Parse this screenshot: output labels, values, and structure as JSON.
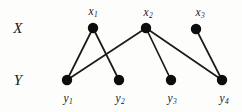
{
  "figure": {
    "type": "bipartite-graph-diagram",
    "width": 242,
    "height": 112,
    "background_color": "#fdfdfc",
    "node_color": "#0d0d0d",
    "edge_color": "#1a1a1a"
  },
  "set_labels": [
    {
      "id": "X",
      "text": "X",
      "x": 18,
      "y": 28
    },
    {
      "id": "Y",
      "text": "Y",
      "x": 18,
      "y": 80
    }
  ],
  "nodes": [
    {
      "id": "x1",
      "set": "X",
      "label": "x",
      "sub": "1",
      "cx": 93,
      "cy": 28,
      "r": 5.2,
      "label_x": 93,
      "label_y": 11
    },
    {
      "id": "x2",
      "set": "X",
      "label": "x",
      "sub": "2",
      "cx": 146,
      "cy": 28,
      "r": 5.2,
      "label_x": 148,
      "label_y": 12
    },
    {
      "id": "x3",
      "set": "X",
      "label": "x",
      "sub": "3",
      "cx": 196,
      "cy": 29,
      "r": 5.2,
      "label_x": 200,
      "label_y": 12
    },
    {
      "id": "y1",
      "set": "Y",
      "label": "y",
      "sub": "1",
      "cx": 67,
      "cy": 80,
      "r": 5.2,
      "label_x": 68,
      "label_y": 98
    },
    {
      "id": "y2",
      "set": "Y",
      "label": "y",
      "sub": "2",
      "cx": 119,
      "cy": 80,
      "r": 5.2,
      "label_x": 120,
      "label_y": 98
    },
    {
      "id": "y3",
      "set": "Y",
      "label": "y",
      "sub": "3",
      "cx": 171,
      "cy": 80,
      "r": 5.2,
      "label_x": 172,
      "label_y": 98
    },
    {
      "id": "y4",
      "set": "Y",
      "label": "y",
      "sub": "4",
      "cx": 222,
      "cy": 80,
      "r": 5.2,
      "label_x": 224,
      "label_y": 98
    }
  ],
  "edges": [
    {
      "from": "x1",
      "to": "y1",
      "x1": 93,
      "y1": 28,
      "x2": 67,
      "y2": 80
    },
    {
      "from": "x1",
      "to": "y2",
      "x1": 93,
      "y1": 28,
      "x2": 119,
      "y2": 80
    },
    {
      "from": "x2",
      "to": "y1",
      "x1": 146,
      "y1": 28,
      "x2": 67,
      "y2": 80
    },
    {
      "from": "x2",
      "to": "y3",
      "x1": 146,
      "y1": 28,
      "x2": 171,
      "y2": 80
    },
    {
      "from": "x2",
      "to": "y4",
      "x1": 146,
      "y1": 28,
      "x2": 222,
      "y2": 80
    },
    {
      "from": "x3",
      "to": "y4",
      "x1": 196,
      "y1": 29,
      "x2": 222,
      "y2": 80
    }
  ]
}
